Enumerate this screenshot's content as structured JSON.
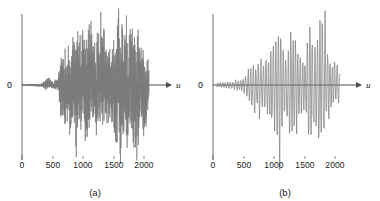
{
  "figure": {
    "background_color": "#ffffff",
    "trace_color": "#7a7a7a",
    "axis_color": "#4d4d4d",
    "text_color": "#1a1a1a"
  },
  "panels": [
    {
      "id": "panel-a",
      "caption": "(a)",
      "y_zero_label": "0",
      "x_axis_variable": "u",
      "xticks": [
        "0",
        "500",
        "1000",
        "1500",
        "2000"
      ]
    },
    {
      "id": "panel-b",
      "caption": "(b)",
      "y_zero_label": "0",
      "x_axis_variable": "u",
      "xticks": [
        "0",
        "500",
        "1000",
        "1500",
        "2000"
      ]
    }
  ],
  "chart_data": {
    "type": "line",
    "title": "",
    "xlabel": "u",
    "ylabel": "",
    "grid": false,
    "legend": false,
    "xlim": [
      0,
      2400
    ],
    "ylim": [
      -1.0,
      1.0
    ],
    "xticks": [
      0,
      500,
      1000,
      1500,
      2000
    ],
    "yticks": [
      0
    ],
    "yticklabels": [
      "0"
    ],
    "subplots": [
      {
        "name": "(a)",
        "description": "High-frequency noisy signal trace; near-zero amplitude until about u=430, small bursts 430-640, then large dense oscillations from u=650 to u=2100.",
        "x_start": 0,
        "x_end": 2100,
        "n_samples": 2100,
        "envelope_x": [
          0,
          300,
          430,
          470,
          520,
          600,
          650,
          700,
          800,
          900,
          1000,
          1100,
          1200,
          1300,
          1400,
          1500,
          1600,
          1700,
          1800,
          1900,
          2000,
          2050,
          2100
        ],
        "envelope_y": [
          0.01,
          0.02,
          0.1,
          0.07,
          0.05,
          0.08,
          0.55,
          0.5,
          0.62,
          0.7,
          0.66,
          0.82,
          0.6,
          0.7,
          0.55,
          0.62,
          0.98,
          0.72,
          0.9,
          0.8,
          0.6,
          0.45,
          0.3
        ],
        "oscillation_period": 7
      },
      {
        "name": "(b)",
        "description": "Smoothed low-frequency version of the same trace; small ripples from u=60 to u=600, growing oscillations from u=600, peaks near u=1100, 1350 and 1800, decaying after u=1900.",
        "x_start": 60,
        "x_end": 2100,
        "n_samples": 2040,
        "envelope_x": [
          60,
          200,
          350,
          500,
          600,
          700,
          800,
          900,
          1000,
          1100,
          1200,
          1300,
          1400,
          1500,
          1600,
          1700,
          1800,
          1900,
          2000,
          2050,
          2100
        ],
        "envelope_y": [
          0.04,
          0.05,
          0.07,
          0.1,
          0.3,
          0.45,
          0.38,
          0.5,
          0.72,
          0.92,
          0.55,
          0.95,
          0.6,
          0.52,
          0.9,
          0.95,
          0.98,
          0.62,
          0.4,
          0.32,
          0.25
        ],
        "oscillation_period": 42
      }
    ]
  },
  "geometry": {
    "panel_width": 190,
    "axis_x_a": 22,
    "axis_x_b": 23,
    "baseline_y": 85,
    "axis_top_y": 14,
    "axis_bottom_y": 160,
    "x_pixel_per_unit": 0.0605,
    "tick_y": 158,
    "tick_len": 3,
    "arrow_end_x": 168
  }
}
